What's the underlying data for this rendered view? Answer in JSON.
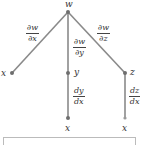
{
  "diagram": {
    "type": "tree",
    "root": {
      "label": "w"
    },
    "level1": [
      {
        "label": "x",
        "edge_label": {
          "num": "∂w",
          "den": "∂x"
        }
      },
      {
        "label": "y",
        "edge_label": {
          "num": "∂w",
          "den": "∂y"
        }
      },
      {
        "label": "z",
        "edge_label": {
          "num": "∂w",
          "den": "∂z"
        }
      }
    ],
    "level2": [
      {
        "parent": "y",
        "label": "x",
        "edge_label": {
          "num": "dy",
          "den": "dx"
        }
      },
      {
        "parent": "z",
        "label": "x",
        "edge_label": {
          "num": "dz",
          "den": "dx"
        }
      }
    ],
    "colors": {
      "edge": "#8a8a8a",
      "node": "#6e6e6e",
      "text": "#333333"
    }
  }
}
